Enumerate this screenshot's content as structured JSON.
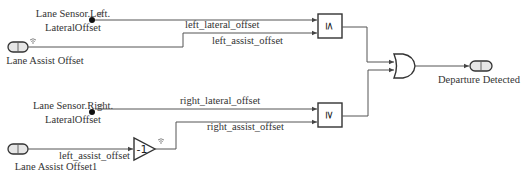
{
  "diagram": {
    "inputs": {
      "left_sensor": {
        "line1": "Lane Sensor.Left.",
        "line2": "LateralOffset"
      },
      "right_sensor": {
        "line1": "Lane Sensor.Right.",
        "line2": "LateralOffset"
      },
      "assist_offset": {
        "label": "Lane Assist Offset",
        "port_number": "1"
      },
      "assist_offset1": {
        "label": "Lane Assist Offset1",
        "port_number": "1"
      }
    },
    "signals": {
      "left_lateral": "left_lateral_offset",
      "left_assist": "left_assist_offset",
      "right_lateral": "right_lateral_offset",
      "right_assist": "right_assist_offset",
      "gain_input": "left_assist_offset"
    },
    "blocks": {
      "compare_top": {
        "operator": "≤"
      },
      "compare_bottom": {
        "operator": "≥"
      },
      "gain": {
        "value": "-1"
      },
      "logic": {
        "operator": "OR"
      }
    },
    "outputs": {
      "departure": {
        "label": "Departure Detected",
        "port_number": "1"
      }
    },
    "signal_icon": "wireless-signal-icon"
  }
}
